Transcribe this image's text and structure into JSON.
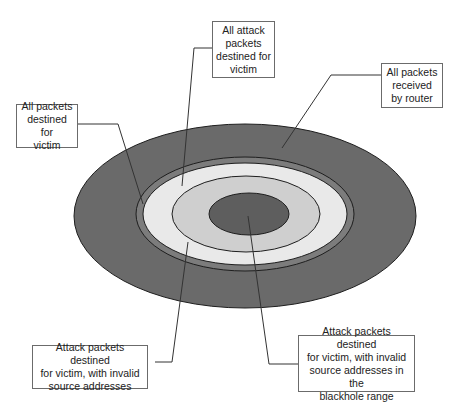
{
  "diagram": {
    "type": "nested-ellipse-set-diagram",
    "colors": {
      "outer_fill": "#6a6a6a",
      "band_fill": "#7c7c7c",
      "light_fill": "#e9e9e9",
      "mid_fill": "#cfcfcf",
      "core_fill": "#5e5e5e",
      "stroke": "#1e1e1e",
      "connector": "#333333",
      "box_border": "#6b6b6b"
    },
    "regions": [
      {
        "id": "all-packets-received",
        "label": "All packets\nreceived\nby router"
      },
      {
        "id": "all-packets-destined",
        "label": "All packets\ndestined for\nvictim"
      },
      {
        "id": "all-attack-packets",
        "label": "All attack\npackets\ndestined for\nvictim"
      },
      {
        "id": "invalid-source",
        "label": "Attack packets destined\nfor victim, with invalid\nsource addresses"
      },
      {
        "id": "blackhole-range",
        "label": "Attack packets destined\nfor victim, with invalid\nsource addresses in the\nblackhole range"
      }
    ]
  }
}
